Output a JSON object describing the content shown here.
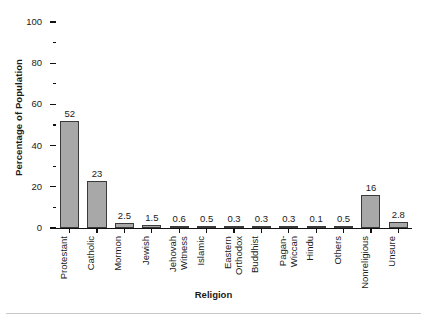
{
  "chart_data": {
    "type": "bar",
    "title": "",
    "xlabel": "Religion",
    "ylabel": "Percentage of Population",
    "categories": [
      "Protestant",
      "Catholic",
      "Mormon",
      "Jewish",
      "Jehovah Witness",
      "Islamic",
      "Eastern Orthodox",
      "Buddhist",
      "Pagan-Wiccan",
      "Hindu",
      "Others",
      "Nonreligious",
      "Unsure"
    ],
    "category_lines": [
      [
        "Protestant",
        ""
      ],
      [
        "Catholic",
        ""
      ],
      [
        "Mormon",
        ""
      ],
      [
        "Jewish",
        ""
      ],
      [
        "Jehovah",
        "Witness"
      ],
      [
        "Islamic",
        ""
      ],
      [
        "Eastern",
        "Orthodox"
      ],
      [
        "Buddhist",
        ""
      ],
      [
        "Pagan-",
        "Wiccan"
      ],
      [
        "Hindu",
        ""
      ],
      [
        "Others",
        ""
      ],
      [
        "Nonreligious",
        ""
      ],
      [
        "Unsure",
        ""
      ]
    ],
    "values": [
      52,
      23,
      2.5,
      1.5,
      0.6,
      0.5,
      0.3,
      0.3,
      0.3,
      0.1,
      0.5,
      16,
      2.8
    ],
    "value_labels": [
      "52",
      "23",
      "2.5",
      "1.5",
      "0.6",
      "0.5",
      "0.3",
      "0.3",
      "0.3",
      "0.1",
      "0.5",
      "16",
      "2.8"
    ],
    "ylim": [
      0,
      100
    ],
    "ytick_major": [
      0,
      20,
      40,
      60,
      80,
      100
    ],
    "ytick_minor": [
      10,
      30,
      50,
      70,
      90
    ],
    "ytick_labels": [
      "0",
      "20",
      "40",
      "60",
      "80",
      "100"
    ],
    "grid": false,
    "legend": null,
    "bar_fill_color": "#a8a8a8",
    "bar_edge_color": "#3a3a3a",
    "axis_color": "#111111"
  }
}
